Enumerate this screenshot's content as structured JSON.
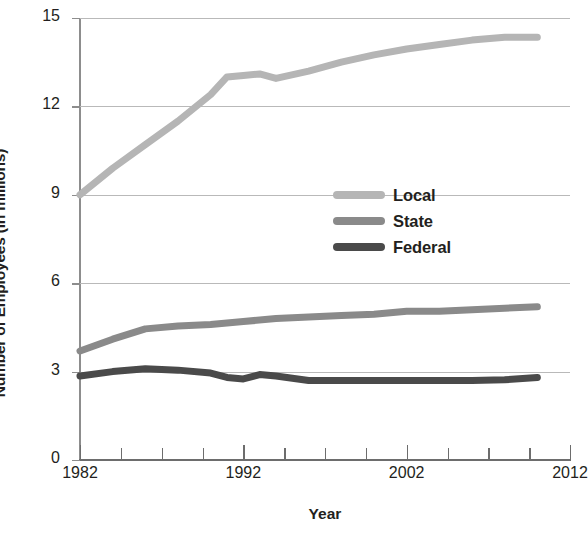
{
  "chart_data": {
    "type": "line",
    "title": "",
    "xlabel": "Year",
    "ylabel": "Number of Employees (in millions)",
    "xlim": [
      1982,
      2012
    ],
    "ylim": [
      0,
      15
    ],
    "xticks": [
      1982,
      1992,
      2002,
      2012
    ],
    "xtick_labels": [
      "1982",
      "1992",
      "2002",
      "2012"
    ],
    "xticks_minor": [
      1984.5,
      1987,
      1989.5,
      1994.5,
      1997,
      1999.5,
      2004.5,
      2007,
      2009.5
    ],
    "yticks": [
      0,
      3,
      6,
      9,
      12,
      15
    ],
    "ytick_labels": [
      "0",
      "3",
      "6",
      "9",
      "12",
      "15"
    ],
    "grid": "horizontal",
    "legend_position": "center-right",
    "series": [
      {
        "name": "Local",
        "color": "#b5b5b5",
        "x": [
          1982,
          1984,
          1986,
          1988,
          1990,
          1991,
          1992,
          1993,
          1994,
          1996,
          1998,
          2000,
          2002,
          2004,
          2006,
          2008,
          2010
        ],
        "values": [
          9.0,
          9.9,
          10.7,
          11.5,
          12.4,
          13.0,
          13.05,
          13.1,
          12.95,
          13.2,
          13.5,
          13.75,
          13.95,
          14.1,
          14.25,
          14.35,
          14.35
        ]
      },
      {
        "name": "State",
        "color": "#8a8a8a",
        "x": [
          1982,
          1984,
          1986,
          1988,
          1990,
          1992,
          1994,
          1996,
          1998,
          2000,
          2002,
          2004,
          2006,
          2008,
          2010
        ],
        "values": [
          3.7,
          4.1,
          4.45,
          4.55,
          4.6,
          4.7,
          4.8,
          4.85,
          4.9,
          4.95,
          5.05,
          5.05,
          5.1,
          5.15,
          5.2
        ]
      },
      {
        "name": "Federal",
        "color": "#4a4a4a",
        "x": [
          1982,
          1984,
          1986,
          1988,
          1990,
          1991,
          1992,
          1993,
          1994,
          1996,
          1998,
          2000,
          2002,
          2004,
          2006,
          2008,
          2010
        ],
        "values": [
          2.85,
          3.0,
          3.1,
          3.05,
          2.95,
          2.8,
          2.75,
          2.9,
          2.85,
          2.7,
          2.7,
          2.7,
          2.7,
          2.7,
          2.7,
          2.72,
          2.8
        ]
      }
    ]
  },
  "legend": {
    "items": [
      {
        "label": "Local",
        "color": "#b5b5b5"
      },
      {
        "label": "State",
        "color": "#8a8a8a"
      },
      {
        "label": "Federal",
        "color": "#4a4a4a"
      }
    ]
  },
  "axes": {
    "y_title": "Number of Employees (in millions)",
    "x_title": "Year"
  }
}
